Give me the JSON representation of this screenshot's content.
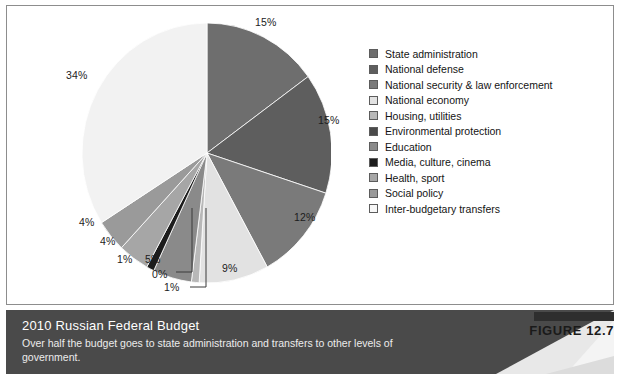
{
  "figure": {
    "tag_label": "FIGURE 12.7",
    "caption_title": "2010 Russian Federal Budget",
    "caption_subtitle": "Over half the budget goes to state administration and transfers to other levels of government.",
    "band_color": "#4a4a4a",
    "band_wedge_color": "#e8e8e8",
    "tag_bar_color": "#2e2e2e"
  },
  "chart_data": {
    "type": "pie",
    "title": "2010 Russian Federal Budget",
    "subtitle": "Over half the budget goes to state administration and transfers to other levels of government.",
    "unit": "percent",
    "legend_position": "right",
    "start_angle_deg": 0,
    "direction": "clockwise",
    "categories": [
      "State administration",
      "National defense",
      "National security & law enforcement",
      "National economy",
      "Housing, utilities",
      "Environmental protection",
      "Education",
      "Media, culture, cinema",
      "Health, sport",
      "Social policy",
      "Inter-budgetary transfers"
    ],
    "values": [
      15,
      15,
      12,
      9,
      1,
      0,
      5,
      1,
      4,
      4,
      34
    ],
    "labels": [
      "15%",
      "15%",
      "12%",
      "9%",
      "1%",
      "0%",
      "5%",
      "1%",
      "4%",
      "4%",
      "34%"
    ],
    "colors": [
      "#6e6e6e",
      "#5e5e5e",
      "#7a7a7a",
      "#e2e2e2",
      "#b8b8b8",
      "#4a4a4a",
      "#8a8a8a",
      "#1c1c1c",
      "#a6a6a6",
      "#9a9a9a",
      "#f2f2f2"
    ]
  },
  "legend": {
    "items": [
      {
        "label": "State administration",
        "color": "#6e6e6e"
      },
      {
        "label": "National defense",
        "color": "#5e5e5e"
      },
      {
        "label": "National security & law enforcement",
        "color": "#7a7a7a"
      },
      {
        "label": "National economy",
        "color": "#e2e2e2"
      },
      {
        "label": "Housing, utilities",
        "color": "#b8b8b8"
      },
      {
        "label": "Environmental protection",
        "color": "#4a4a4a"
      },
      {
        "label": "Education",
        "color": "#8a8a8a"
      },
      {
        "label": "Media, culture, cinema",
        "color": "#1c1c1c"
      },
      {
        "label": "Health, sport",
        "color": "#a6a6a6"
      },
      {
        "label": "Social policy",
        "color": "#9a9a9a"
      },
      {
        "label": "Inter-budgetary transfers",
        "color": "#f7f7f7"
      }
    ]
  },
  "pie_labels": [
    {
      "text": "15%",
      "left": 255,
      "top": 16
    },
    {
      "text": "15%",
      "left": 318,
      "top": 114
    },
    {
      "text": "12%",
      "left": 294,
      "top": 211
    },
    {
      "text": "9%",
      "left": 222,
      "top": 262
    },
    {
      "text": "1%",
      "left": 164,
      "top": 281
    },
    {
      "text": "0%",
      "left": 152,
      "top": 268
    },
    {
      "text": "5%",
      "left": 145,
      "top": 253
    },
    {
      "text": "1%",
      "left": 117,
      "top": 253
    },
    {
      "text": "4%",
      "left": 100,
      "top": 235
    },
    {
      "text": "4%",
      "left": 79,
      "top": 216
    },
    {
      "text": "34%",
      "left": 66,
      "top": 69
    }
  ]
}
